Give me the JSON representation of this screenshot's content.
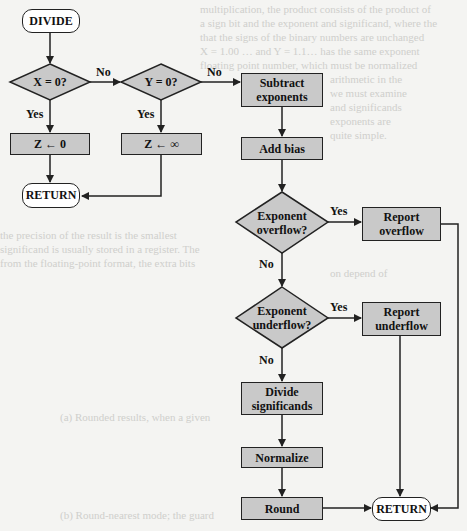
{
  "diagram": {
    "type": "flowchart",
    "nodes": {
      "start": "DIVIDE",
      "x_zero": "X = 0?",
      "y_zero": "Y = 0?",
      "z_zero": "Z ← 0",
      "z_inf": "Z ← ∞",
      "return_left": "RETURN",
      "subtract_1": "Subtract",
      "subtract_2": "exponents",
      "add_bias": "Add bias",
      "exp_over_1": "Exponent",
      "exp_over_2": "overflow?",
      "report_over_1": "Report",
      "report_over_2": "overflow",
      "exp_under_1": "Exponent",
      "exp_under_2": "underflow?",
      "report_under_1": "Report",
      "report_under_2": "underflow",
      "divide_1": "Divide",
      "divide_2": "significands",
      "normalize": "Normalize",
      "round": "Round",
      "return_right": "RETURN"
    },
    "edge_labels": {
      "x_no": "No",
      "x_yes": "Yes",
      "y_no": "No",
      "y_yes": "Yes",
      "over_yes": "Yes",
      "over_no": "No",
      "under_yes": "Yes",
      "under_no": "No"
    },
    "colors": {
      "process_fill": "#c9c9c9",
      "terminal_fill": "#ffffff",
      "stroke": "#222222",
      "background": "#f4f4f2"
    }
  }
}
